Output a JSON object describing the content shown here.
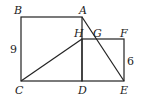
{
  "diagram": {
    "points": {
      "A": {
        "label": "A",
        "x": 82,
        "y": 17
      },
      "B": {
        "label": "B",
        "x": 21,
        "y": 17
      },
      "C": {
        "label": "C",
        "x": 21,
        "y": 81
      },
      "D": {
        "label": "D",
        "x": 82,
        "y": 81
      },
      "E": {
        "label": "E",
        "x": 124,
        "y": 81
      },
      "F": {
        "label": "F",
        "x": 124,
        "y": 39
      },
      "G": {
        "label": "G",
        "x": 96,
        "y": 39
      },
      "H": {
        "label": "H",
        "x": 82,
        "y": 39
      }
    },
    "measures": {
      "BC": "9",
      "EF": "6"
    },
    "stroke_color": "#222222"
  }
}
